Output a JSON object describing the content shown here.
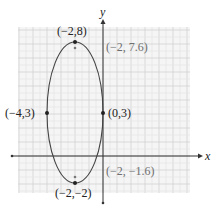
{
  "chart_data": {
    "type": "line",
    "title": "",
    "xlabel": "x",
    "ylabel": "y",
    "xlim": [
      -6,
      6
    ],
    "ylim": [
      -2.5,
      9
    ],
    "grid": true,
    "grid_step": 0.5,
    "curve": {
      "shape": "ellipse",
      "center": [
        -2,
        3
      ],
      "semi_major_vertical": 5,
      "semi_minor_horizontal": 2
    },
    "points": [
      {
        "label": "(−2,8)",
        "x": -2,
        "y": 8,
        "kind": "vertex",
        "style": "dark"
      },
      {
        "label": "(−2,−2)",
        "x": -2,
        "y": -2,
        "kind": "vertex",
        "style": "dark"
      },
      {
        "label": "(−4,3)",
        "x": -4,
        "y": 3,
        "kind": "co-vertex",
        "style": "dark"
      },
      {
        "label": "(0,3)",
        "x": 0,
        "y": 3,
        "kind": "co-vertex",
        "style": "dark"
      },
      {
        "label": "(−2, 7.6)",
        "x": -2,
        "y": 7.6,
        "kind": "focus",
        "style": "grey"
      },
      {
        "label": "(−2, −1.6)",
        "x": -2,
        "y": -1.6,
        "kind": "focus",
        "style": "grey"
      }
    ],
    "annotations": [
      "(−2,8)",
      "(−2, 7.6)",
      "(−4,3)",
      "(0,3)",
      "(−2, −1.6)",
      "(−2,−2)"
    ]
  },
  "labels": {
    "x_axis": "x",
    "y_axis": "y",
    "vertex_top": "(−2,8)",
    "vertex_bottom": "(−2,−2)",
    "covertex_left": "(−4,3)",
    "covertex_right": "(0,3)",
    "focus_top": "(−2, 7.6)",
    "focus_bottom": "(−2, −1.6)"
  },
  "colors": {
    "grid_minor": "#e6e6e6",
    "grid_major": "#d2d2d2",
    "grid_bg": "#f5f5f5",
    "axis": "#333333",
    "curve": "#444444",
    "focus_label": "#6f6f6f"
  }
}
